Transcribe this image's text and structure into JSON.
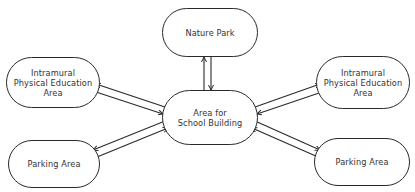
{
  "diagram": {
    "type": "hub-and-spoke",
    "center": {
      "id": "school-building",
      "lines": [
        "Area for",
        "School Building"
      ]
    },
    "nodes": {
      "nature_park": {
        "lines": [
          "Nature Park"
        ]
      },
      "ipe_left": {
        "lines": [
          "Intramural",
          "Physical Education",
          "Area"
        ]
      },
      "parking_left": {
        "lines": [
          "Parking Area"
        ]
      },
      "ipe_right": {
        "lines": [
          "Intramural",
          "Physical Education",
          "Area"
        ]
      },
      "parking_right": {
        "lines": [
          "Parking Area"
        ]
      }
    },
    "connections": [
      {
        "from": "school-building",
        "to": "nature_park",
        "style": "double-line-bidirectional"
      },
      {
        "from": "school-building",
        "to": "ipe_left",
        "style": "double-line-bidirectional"
      },
      {
        "from": "school-building",
        "to": "parking_left",
        "style": "double-line-bidirectional"
      },
      {
        "from": "school-building",
        "to": "ipe_right",
        "style": "double-line-bidirectional"
      },
      {
        "from": "school-building",
        "to": "parking_right",
        "style": "double-line-bidirectional"
      }
    ],
    "colors": {
      "stroke": "#2a2a2a",
      "text": "#333333",
      "background": "#ffffff"
    }
  }
}
